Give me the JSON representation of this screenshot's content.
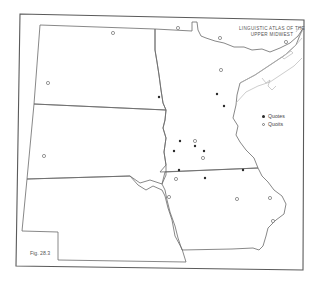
{
  "map": {
    "title_line1": "Linguistic Atlas of the",
    "title_line2": "Upper Midwest",
    "figure_label": "Fig. 28.3",
    "legend": [
      {
        "symbol": "filled-dot",
        "label": "Quotes"
      },
      {
        "symbol": "open-circle",
        "label": "Quoits"
      }
    ],
    "states_depicted": [
      "North Dakota",
      "South Dakota",
      "Nebraska",
      "Minnesota",
      "Iowa"
    ],
    "markers": {
      "quotes": [
        {
          "x": 159,
          "y": 97
        },
        {
          "x": 217,
          "y": 94
        },
        {
          "x": 224,
          "y": 106
        },
        {
          "x": 180,
          "y": 141
        },
        {
          "x": 195,
          "y": 146
        },
        {
          "x": 174,
          "y": 151
        },
        {
          "x": 206,
          "y": 150
        },
        {
          "x": 179,
          "y": 170
        },
        {
          "x": 243,
          "y": 170
        },
        {
          "x": 205,
          "y": 178
        }
      ],
      "quoits": [
        {
          "x": 113,
          "y": 33
        },
        {
          "x": 178,
          "y": 28
        },
        {
          "x": 220,
          "y": 38
        },
        {
          "x": 286,
          "y": 42
        },
        {
          "x": 48,
          "y": 83
        },
        {
          "x": 221,
          "y": 70
        },
        {
          "x": 195,
          "y": 141
        },
        {
          "x": 203,
          "y": 158
        },
        {
          "x": 44,
          "y": 156
        },
        {
          "x": 176,
          "y": 179
        },
        {
          "x": 169,
          "y": 197
        },
        {
          "x": 237,
          "y": 199
        },
        {
          "x": 270,
          "y": 198
        },
        {
          "x": 273,
          "y": 221
        },
        {
          "x": 195,
          "y": 143
        }
      ]
    }
  }
}
